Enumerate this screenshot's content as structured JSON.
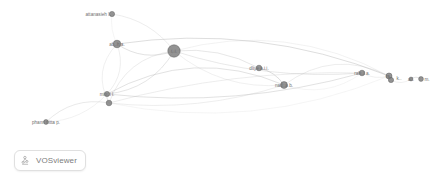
{
  "app": {
    "name": "VOSviewer",
    "badge_label": "VOSviewer",
    "icon": "vosviewer-logo-icon"
  },
  "canvas": {
    "width": 444,
    "height": 187,
    "background": "#ffffff",
    "node_fill": "#808080",
    "node_stroke": "#5e5e5e",
    "edge_color": "#b9b9b9",
    "label_color": "#6f6f6f"
  },
  "chart_data": {
    "type": "network",
    "title": "",
    "layout": "vosviewer-network-visualization",
    "nodes": [
      {
        "id": "n1",
        "label": "attanasieh l.",
        "x": 112,
        "y": 14,
        "r": 2.6,
        "label_dx": -14,
        "label_dy": 0
      },
      {
        "id": "n2",
        "label": "ab..h a.",
        "x": 117,
        "y": 44,
        "r": 3.8,
        "label_dx": 0,
        "label_dy": 0
      },
      {
        "id": "n3",
        "label": "t..i.",
        "x": 174,
        "y": 51,
        "r": 6.2,
        "label_dx": 0,
        "label_dy": 0
      },
      {
        "id": "n4",
        "label": "dliye a.i.i.",
        "x": 259,
        "y": 68,
        "r": 2.8,
        "label_dx": 0,
        "label_dy": 0
      },
      {
        "id": "n5",
        "label": "nad..a b.",
        "x": 284,
        "y": 85,
        "r": 3.4,
        "label_dx": 0,
        "label_dy": 0
      },
      {
        "id": "n6",
        "label": "rah..i a.",
        "x": 362,
        "y": 73,
        "r": 2.8,
        "label_dx": 0,
        "label_dy": 0
      },
      {
        "id": "n7",
        "label": "ra..",
        "x": 389,
        "y": 76,
        "r": 3.0,
        "label_dx": 0,
        "label_dy": 0
      },
      {
        "id": "n8",
        "label": "k..",
        "x": 391,
        "y": 80,
        "r": 2.6,
        "label_dx": 8,
        "label_dy": -2
      },
      {
        "id": "n9",
        "label": "a.l.",
        "x": 411,
        "y": 79,
        "r": 1.9,
        "label_dx": 0,
        "label_dy": 0
      },
      {
        "id": "n10",
        "label": "m.",
        "x": 421,
        "y": 79,
        "r": 2.4,
        "label_dx": 6,
        "label_dy": 0
      },
      {
        "id": "n11",
        "label": "min..i l.",
        "x": 107,
        "y": 94,
        "r": 2.6,
        "label_dx": 0,
        "label_dy": 0
      },
      {
        "id": "n12",
        "label": "",
        "x": 109,
        "y": 103,
        "r": 2.8,
        "label_dx": 0,
        "label_dy": 0
      },
      {
        "id": "n13",
        "label": "phann nitta p.",
        "x": 46,
        "y": 122,
        "r": 2.4,
        "label_dx": 0,
        "label_dy": 0
      }
    ],
    "edges": [
      {
        "source": "n1",
        "target": "n2"
      },
      {
        "source": "n1",
        "target": "n3"
      },
      {
        "source": "n2",
        "target": "n3"
      },
      {
        "source": "n2",
        "target": "n11"
      },
      {
        "source": "n2",
        "target": "n12"
      },
      {
        "source": "n3",
        "target": "n4"
      },
      {
        "source": "n3",
        "target": "n5"
      },
      {
        "source": "n3",
        "target": "n11"
      },
      {
        "source": "n3",
        "target": "n12"
      },
      {
        "source": "n3",
        "target": "n7"
      },
      {
        "source": "n3",
        "target": "n6"
      },
      {
        "source": "n4",
        "target": "n5"
      },
      {
        "source": "n5",
        "target": "n6"
      },
      {
        "source": "n5",
        "target": "n7"
      },
      {
        "source": "n5",
        "target": "n11"
      },
      {
        "source": "n5",
        "target": "n12"
      },
      {
        "source": "n6",
        "target": "n7"
      },
      {
        "source": "n7",
        "target": "n8"
      },
      {
        "source": "n8",
        "target": "n9"
      },
      {
        "source": "n9",
        "target": "n10"
      },
      {
        "source": "n11",
        "target": "n12"
      },
      {
        "source": "n11",
        "target": "n13"
      },
      {
        "source": "n12",
        "target": "n13"
      },
      {
        "source": "n2",
        "target": "n7"
      },
      {
        "source": "n12",
        "target": "n7"
      },
      {
        "source": "n12",
        "target": "n6"
      },
      {
        "source": "n11",
        "target": "n6"
      }
    ]
  }
}
